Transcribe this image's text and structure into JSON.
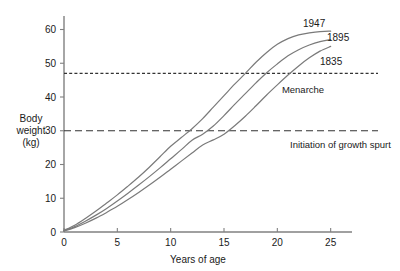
{
  "chart_data": {
    "type": "line",
    "title": "",
    "xlabel": "Years of age",
    "ylabel": "Body weight (kg)",
    "ylabel_lines": [
      "Body",
      "weight",
      "(kg)"
    ],
    "xlim": [
      0,
      27
    ],
    "ylim": [
      0,
      64
    ],
    "grid": false,
    "legend_position": "right-inline",
    "xticks": [
      "0",
      "5",
      "10",
      "15",
      "20",
      "25"
    ],
    "xtick_values": [
      0,
      5,
      10,
      15,
      20,
      25
    ],
    "yticks": [
      "0",
      "10",
      "20",
      "30",
      "40",
      "50",
      "60"
    ],
    "ytick_values": [
      0,
      10,
      20,
      30,
      40,
      50,
      60
    ],
    "series": [
      {
        "name": "1947",
        "label": "1947",
        "color": "#7a7a7a",
        "x": [
          0,
          1,
          2,
          3,
          4,
          5,
          6,
          7,
          8,
          9,
          10,
          11,
          12,
          13,
          14,
          15,
          16,
          17,
          18,
          19,
          20,
          21,
          22,
          23,
          24,
          25
        ],
        "values": [
          0.5,
          2.0,
          4.0,
          6.2,
          8.6,
          11.0,
          13.6,
          16.3,
          19.2,
          22.3,
          25.4,
          28.0,
          30.6,
          33.6,
          37.0,
          40.4,
          43.8,
          47.0,
          50.3,
          53.2,
          55.6,
          57.3,
          58.4,
          59.0,
          59.4,
          59.5
        ]
      },
      {
        "name": "1895",
        "label": "1895",
        "color": "#7a7a7a",
        "x": [
          0,
          1,
          2,
          3,
          4,
          5,
          6,
          7,
          8,
          9,
          10,
          11,
          12,
          13,
          14,
          15,
          16,
          17,
          18,
          19,
          20,
          21,
          22,
          23,
          24,
          25
        ],
        "values": [
          0.4,
          1.6,
          3.2,
          5.0,
          7.0,
          9.2,
          11.5,
          13.9,
          16.4,
          19.0,
          21.7,
          24.4,
          27.2,
          29.0,
          31.4,
          34.5,
          37.8,
          41.0,
          44.2,
          47.2,
          49.8,
          52.2,
          54.0,
          55.4,
          56.4,
          57.0
        ]
      },
      {
        "name": "1835",
        "label": "1835",
        "color": "#7a7a7a",
        "x": [
          0,
          1,
          2,
          3,
          4,
          5,
          6,
          7,
          8,
          9,
          10,
          11,
          12,
          13,
          14,
          15,
          16,
          17,
          18,
          19,
          20,
          21,
          22,
          23,
          24,
          25
        ],
        "values": [
          0.3,
          1.3,
          2.6,
          4.1,
          5.8,
          7.6,
          9.6,
          11.7,
          13.9,
          16.2,
          18.6,
          21.0,
          23.4,
          25.8,
          27.3,
          29.0,
          31.5,
          34.3,
          37.4,
          40.6,
          43.6,
          46.5,
          49.2,
          51.6,
          53.6,
          55.0
        ]
      }
    ],
    "reference_lines": [
      {
        "name": "menarche",
        "label": "Menarche",
        "value": 47,
        "axis": "y",
        "style": "dotted-dashed",
        "color": "#333333"
      },
      {
        "name": "growth-spurt",
        "label": "Initiation of growth spurt",
        "value": 30,
        "axis": "y",
        "style": "dashed",
        "color": "#333333"
      }
    ],
    "annotations": [
      {
        "name": "menarche-crossings",
        "text": "Menarche",
        "at_y": 47
      },
      {
        "name": "spurt-crossings",
        "text": "Initiation of growth spurt",
        "at_y": 30
      }
    ]
  },
  "colors": {
    "curve": "#7a7a7a",
    "axis": "#808080",
    "text": "#1a1a1a",
    "reference": "#333333",
    "background": "#ffffff"
  }
}
